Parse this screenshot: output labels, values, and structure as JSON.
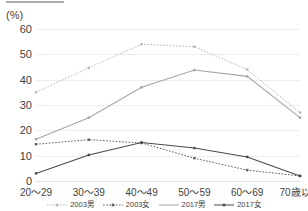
{
  "axis": {
    "unit_label": "(%)",
    "y_ticks": [
      0,
      10,
      20,
      30,
      40,
      50,
      60
    ],
    "x_categories": [
      "20〜29",
      "30〜39",
      "40〜49",
      "50〜59",
      "60〜69",
      "70歳以上"
    ]
  },
  "legend": {
    "items": [
      {
        "label": "2003男",
        "icon": "dotted-line-marker-swatch"
      },
      {
        "label": "2003女",
        "icon": "dotted-line-marker-swatch"
      },
      {
        "label": "2017男",
        "icon": "solid-line-swatch"
      },
      {
        "label": "2017女",
        "icon": "solid-line-marker-swatch"
      }
    ]
  },
  "colors": {
    "series_2003_male": "#b9b9b9",
    "series_2003_female": "#5e5e5e",
    "series_2017_male": "#a6a6a6",
    "series_2017_female": "#4a4a4a",
    "gridline": "#ededed",
    "text": "#3f3f3f",
    "background": "#ffffff"
  },
  "chart_data": {
    "type": "line",
    "title": "",
    "subtitle": "",
    "xlabel": "",
    "ylabel": "(%)",
    "ylim": [
      0,
      60
    ],
    "ytick_step": 10,
    "grid": true,
    "legend_position": "bottom",
    "categories": [
      "20〜29",
      "30〜39",
      "40〜49",
      "50〜59",
      "60〜69",
      "70歳以上"
    ],
    "series": [
      {
        "name": "2003男",
        "style": "dotted",
        "color": "#b9b9b9",
        "marker": "square",
        "values": [
          35.0,
          44.7,
          54.0,
          53.0,
          44.0,
          27.0
        ]
      },
      {
        "name": "2003女",
        "style": "dotted",
        "color": "#5e5e5e",
        "marker": "square",
        "values": [
          14.5,
          16.3,
          15.0,
          9.0,
          4.3,
          2.0
        ]
      },
      {
        "name": "2017男",
        "style": "solid",
        "color": "#a6a6a6",
        "marker": "square",
        "values": [
          16.5,
          25.0,
          37.0,
          43.8,
          41.3,
          25.0
        ]
      },
      {
        "name": "2017女",
        "style": "solid",
        "color": "#4a4a4a",
        "marker": "square",
        "values": [
          3.0,
          10.3,
          15.2,
          13.0,
          9.5,
          2.0
        ]
      }
    ]
  }
}
